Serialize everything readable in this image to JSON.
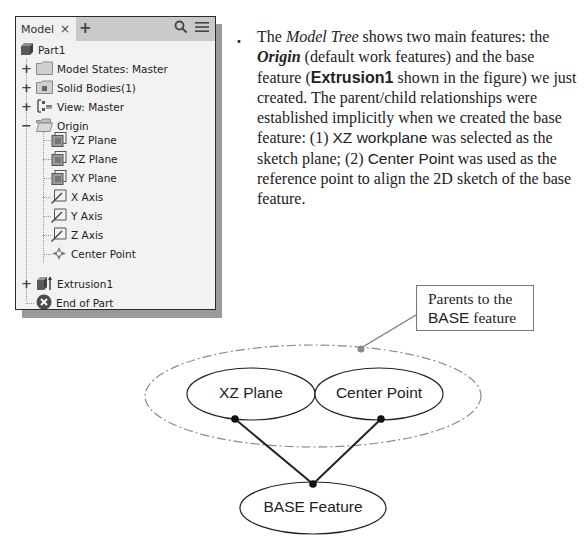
{
  "model_tree": {
    "tab_label": "Model",
    "tab_close": "×",
    "tab_add": "+",
    "header_icons": [
      "search-icon",
      "menu-icon"
    ],
    "root": {
      "label": "Part1",
      "icon": "part-cube-icon"
    },
    "items": [
      {
        "label": "Model States: Master",
        "icon": "folder-icon",
        "expander": "+"
      },
      {
        "label": "Solid Bodies(1)",
        "icon": "solid-bodies-folder-icon",
        "expander": "+"
      },
      {
        "label": "View: Master",
        "icon": "view-rep-icon",
        "expander": "+"
      },
      {
        "label": "Origin",
        "icon": "open-folder-icon",
        "expander": "−"
      }
    ],
    "origin_children": [
      {
        "label": "YZ Plane",
        "icon": "work-plane-icon"
      },
      {
        "label": "XZ Plane",
        "icon": "work-plane-icon"
      },
      {
        "label": "XY Plane",
        "icon": "work-plane-icon"
      },
      {
        "label": "X Axis",
        "icon": "work-axis-icon"
      },
      {
        "label": "Y Axis",
        "icon": "work-axis-icon"
      },
      {
        "label": "Z Axis",
        "icon": "work-axis-icon"
      },
      {
        "label": "Center Point",
        "icon": "work-point-icon"
      }
    ],
    "features": [
      {
        "label": "Extrusion1",
        "icon": "extrusion-icon",
        "expander": "+"
      },
      {
        "label": "End of Part",
        "icon": "end-of-part-icon"
      }
    ]
  },
  "paragraph": {
    "bullet": "•",
    "t1": "The ",
    "model_tree": "Model Tree",
    "t2": " shows two main features: the ",
    "origin": "Origin",
    "t3": " (default work features) and the base feature (",
    "extrusion1": "Extrusion1",
    "t4": " shown in the figure) we just created. The parent/child relationships were established implicitly when we created the base feature: (1) ",
    "xz_workplane": "XZ workplane",
    "t5": " was selected as the sketch plane; (2) ",
    "center_point": "Center Point",
    "t6": " was used as the reference point to align the 2D sketch of the base feature."
  },
  "diagram": {
    "callout": {
      "line1": "Parents to the",
      "line2a": "BASE",
      "line2b": " feature"
    },
    "nodes": {
      "xz_plane": "XZ Plane",
      "center_point": "Center Point",
      "base_feature": "BASE Feature"
    },
    "colors": {
      "stroke": "#222222",
      "dashed": "#8a8a8a",
      "leader": "#777777"
    }
  }
}
